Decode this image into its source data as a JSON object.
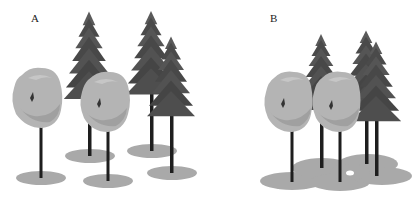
{
  "figure": {
    "panels": [
      {
        "id": "A",
        "label": "A",
        "label_pos": [
          31,
          12
        ],
        "description": "trees with separate, non-overlapping shadows"
      },
      {
        "id": "B",
        "label": "B",
        "label_pos": [
          270,
          12
        ],
        "description": "trees clustered with merged, overlapping shadows"
      }
    ],
    "colors": {
      "background": "#ffffff",
      "shadow": "#a9a9a9",
      "foliage": "#b4b4b4",
      "foliage_dark": "#9a9a9a",
      "conifer": "#4a4a4a",
      "conifer_light": "#6a6a6a",
      "trunk": "#1e1e1e"
    },
    "icons": [
      "deciduous-tree-icon",
      "conifer-tree-icon",
      "ground-shadow-icon"
    ]
  }
}
